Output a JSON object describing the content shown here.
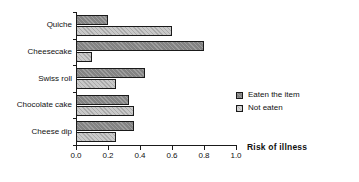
{
  "chart_data": {
    "type": "bar",
    "orientation": "horizontal",
    "title": "",
    "xlabel": "Risk of illness",
    "ylabel": "",
    "categories": [
      "Quiche",
      "Cheesecake",
      "Swiss roll",
      "Chocolate cake",
      "Cheese dip"
    ],
    "series": [
      {
        "name": "Eaten the item",
        "color": "#838383",
        "values": [
          0.2,
          0.8,
          0.43,
          0.33,
          0.36
        ]
      },
      {
        "name": "Not eaten",
        "color": "#c9c9c9",
        "values": [
          0.6,
          0.1,
          0.25,
          0.36,
          0.25
        ]
      }
    ],
    "xlim": [
      0.0,
      1.0
    ],
    "xticks": [
      0.0,
      0.2,
      0.4,
      0.6,
      0.8,
      1.0
    ],
    "xtick_labels": [
      "0.0",
      "0.2",
      "0.4",
      "0.6",
      "0.8",
      "1.0"
    ],
    "grid": false,
    "legend_position": "center-right",
    "legend": [
      {
        "label": "Eaten the item",
        "color": "#838383"
      },
      {
        "label": "Not eaten",
        "color": "#c9c9c9"
      }
    ]
  }
}
